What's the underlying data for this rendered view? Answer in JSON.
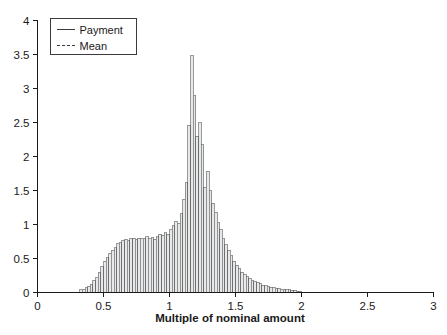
{
  "chart_data": {
    "type": "bar",
    "title": "",
    "subtitle": "",
    "xlabel": "Multiple of nominal amount",
    "ylabel": "",
    "xlim": [
      0,
      3
    ],
    "ylim": [
      0,
      4
    ],
    "grid": false,
    "legend_position": "top-left",
    "bin_width": 0.02,
    "xticks": [
      0,
      0.5,
      1,
      1.5,
      2,
      2.5,
      3
    ],
    "xtick_labels": [
      "0",
      "0.5",
      "1",
      "1.5",
      "2",
      "2.5",
      "3"
    ],
    "yticks": [
      0,
      0.5,
      1,
      1.5,
      2,
      2.5,
      3,
      3.5,
      4
    ],
    "ytick_labels": [
      "0",
      "0.5",
      "1",
      "1.5",
      "2",
      "2.5",
      "3",
      "3.5",
      "4"
    ],
    "legend": [
      {
        "label": "Payment",
        "style": "solid"
      },
      {
        "label": "Mean",
        "style": "dashed"
      }
    ],
    "series": [
      {
        "name": "Payment",
        "style": "histogram",
        "x": [
          0.33,
          0.35,
          0.37,
          0.39,
          0.41,
          0.43,
          0.45,
          0.47,
          0.49,
          0.51,
          0.53,
          0.55,
          0.57,
          0.59,
          0.61,
          0.63,
          0.65,
          0.67,
          0.69,
          0.71,
          0.73,
          0.75,
          0.77,
          0.79,
          0.81,
          0.83,
          0.85,
          0.87,
          0.89,
          0.91,
          0.93,
          0.95,
          0.97,
          0.99,
          1.01,
          1.03,
          1.05,
          1.07,
          1.09,
          1.11,
          1.13,
          1.15,
          1.17,
          1.19,
          1.21,
          1.23,
          1.25,
          1.27,
          1.29,
          1.31,
          1.33,
          1.35,
          1.37,
          1.39,
          1.41,
          1.43,
          1.45,
          1.47,
          1.49,
          1.51,
          1.53,
          1.55,
          1.57,
          1.59,
          1.61,
          1.63,
          1.65,
          1.67,
          1.69,
          1.71,
          1.73,
          1.75,
          1.77,
          1.79,
          1.81,
          1.83,
          1.85,
          1.87,
          1.89,
          1.91,
          1.93,
          1.95,
          1.97,
          1.99
        ],
        "values": [
          0.04,
          0.05,
          0.07,
          0.09,
          0.12,
          0.17,
          0.22,
          0.3,
          0.38,
          0.46,
          0.52,
          0.58,
          0.62,
          0.66,
          0.72,
          0.74,
          0.76,
          0.78,
          0.77,
          0.79,
          0.8,
          0.78,
          0.8,
          0.79,
          0.8,
          0.82,
          0.79,
          0.81,
          0.78,
          0.82,
          0.86,
          0.84,
          0.88,
          0.86,
          0.92,
          0.98,
          1.05,
          1.02,
          1.16,
          1.37,
          1.62,
          2.46,
          3.48,
          2.9,
          2.3,
          2.5,
          2.17,
          1.55,
          1.78,
          1.5,
          1.31,
          1.18,
          1.03,
          0.92,
          0.8,
          0.7,
          0.62,
          0.55,
          0.46,
          0.4,
          0.35,
          0.3,
          0.26,
          0.23,
          0.2,
          0.18,
          0.16,
          0.14,
          0.13,
          0.11,
          0.1,
          0.09,
          0.08,
          0.07,
          0.06,
          0.06,
          0.05,
          0.05,
          0.04,
          0.04,
          0.03,
          0.03,
          0.02,
          0.02
        ]
      },
      {
        "name": "Mean",
        "style": "vline",
        "x": [],
        "values": []
      }
    ]
  }
}
